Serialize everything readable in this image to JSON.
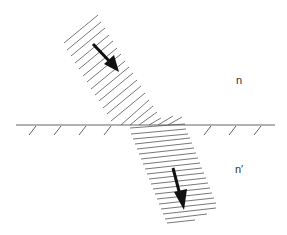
{
  "diagram": {
    "type": "refraction-of-light-beam",
    "labels": {
      "medium_top": "n",
      "medium_bottom": "n′"
    },
    "colors": {
      "line": "#555555",
      "arrow": "#111111",
      "background": "#ffffff"
    }
  }
}
